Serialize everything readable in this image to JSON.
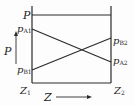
{
  "diagram": {
    "title_label": "P",
    "axis_p_label": "P",
    "axis_z_label": "Z",
    "labels": {
      "pA1": {
        "main": "p",
        "sub": "A1"
      },
      "pB1": {
        "main": "p",
        "sub": "B1"
      },
      "pB2": {
        "main": "p",
        "sub": "B2"
      },
      "pA2": {
        "main": "p",
        "sub": "A2"
      },
      "z1": {
        "main": "Z",
        "sub": "1"
      },
      "z2": {
        "main": "Z",
        "sub": "2"
      }
    },
    "colors": {
      "line": "#2a2a2a",
      "text": "#222222",
      "background": "#fdfdfd"
    }
  }
}
